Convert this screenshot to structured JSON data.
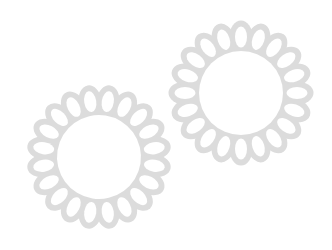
{
  "canvas": {
    "width": 332,
    "height": 250,
    "background_color": "#ffffff",
    "description": "Two overlapping light-gray scalloped flower / doily motifs on a plain white background"
  },
  "palette": {
    "petal_gray": "#dcdcdc",
    "hole_white": "#ffffff",
    "center_white": "#ffffff",
    "background": "#ffffff"
  },
  "shapes": [
    {
      "name": "flower-lower-left",
      "label": "Lower left flower",
      "center_x": 99,
      "center_y": 157,
      "outer_radius": 71,
      "inner_circle_radius": 42,
      "petal_count": 20,
      "petal_center_radius": 56,
      "petal_outer_rx": 11.5,
      "petal_outer_ry": 16.5,
      "petal_hole_rx": 6.0,
      "petal_hole_ry": 10.5,
      "ring_inner_radius": 44,
      "ring_outer_radius": 58,
      "rotation_deg": 9,
      "fill": "#dcdcdc"
    },
    {
      "name": "flower-upper-right",
      "label": "Upper right flower",
      "center_x": 241,
      "center_y": 93,
      "outer_radius": 71,
      "inner_circle_radius": 42,
      "petal_count": 20,
      "petal_center_radius": 56,
      "petal_outer_rx": 11.5,
      "petal_outer_ry": 16.5,
      "petal_hole_rx": 6.0,
      "petal_hole_ry": 10.5,
      "ring_inner_radius": 44,
      "ring_outer_radius": 58,
      "rotation_deg": 0,
      "fill": "#dcdcdc"
    }
  ]
}
